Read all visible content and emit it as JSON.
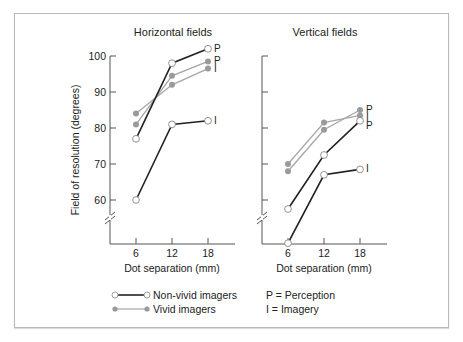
{
  "chart_data": [
    {
      "type": "line",
      "title": "Horizontal fields",
      "xlabel": "Dot separation (mm)",
      "ylabel": "Field of resolution (degrees)",
      "x": [
        6,
        12,
        18
      ],
      "yticks": [
        60,
        70,
        80,
        90,
        100
      ],
      "ylim": [
        50,
        100
      ],
      "axis_break": true,
      "grid": false,
      "series": [
        {
          "name": "Non-vivid imagers - Perception",
          "group": "non-vivid",
          "label": "P",
          "values": [
            77,
            98,
            102
          ]
        },
        {
          "name": "Non-vivid imagers - Imagery",
          "group": "non-vivid",
          "label": "I",
          "values": [
            60,
            81,
            82
          ]
        },
        {
          "name": "Vivid imagers - Perception",
          "group": "vivid",
          "label": "P",
          "values": [
            81,
            94.5,
            98.5
          ]
        },
        {
          "name": "Vivid imagers - Imagery",
          "group": "vivid",
          "label": "I",
          "values": [
            84,
            92,
            96.5
          ]
        }
      ]
    },
    {
      "type": "line",
      "title": "Vertical fields",
      "xlabel": "Dot separation (mm)",
      "ylabel": "",
      "x": [
        6,
        12,
        18
      ],
      "yticks": [
        60,
        70,
        80,
        90,
        100
      ],
      "ylim": [
        50,
        100
      ],
      "axis_break": true,
      "grid": false,
      "series": [
        {
          "name": "Non-vivid imagers - Perception",
          "group": "non-vivid",
          "label": "P",
          "values": [
            57.5,
            72.5,
            82
          ]
        },
        {
          "name": "Non-vivid imagers - Imagery",
          "group": "non-vivid",
          "label": "I",
          "values": [
            48,
            67,
            68.5
          ]
        },
        {
          "name": "Vivid imagers - Perception",
          "group": "vivid",
          "label": "P",
          "values": [
            68,
            79.5,
            85
          ]
        },
        {
          "name": "Vivid imagers - Imagery",
          "group": "vivid",
          "label": "I",
          "values": [
            70,
            81.5,
            83.5
          ]
        }
      ]
    }
  ],
  "legend": {
    "items": [
      {
        "label": "Non-vivid imagers",
        "style": "non-vivid"
      },
      {
        "label": "Vivid imagers",
        "style": "vivid"
      }
    ],
    "key": [
      {
        "label": "P = Perception"
      },
      {
        "label": "I = Imagery"
      }
    ]
  },
  "colors": {
    "non_vivid_line": "#222222",
    "vivid_line": "#a6a6a6",
    "vivid_marker": "#9a9a9a",
    "axis": "#555555"
  }
}
